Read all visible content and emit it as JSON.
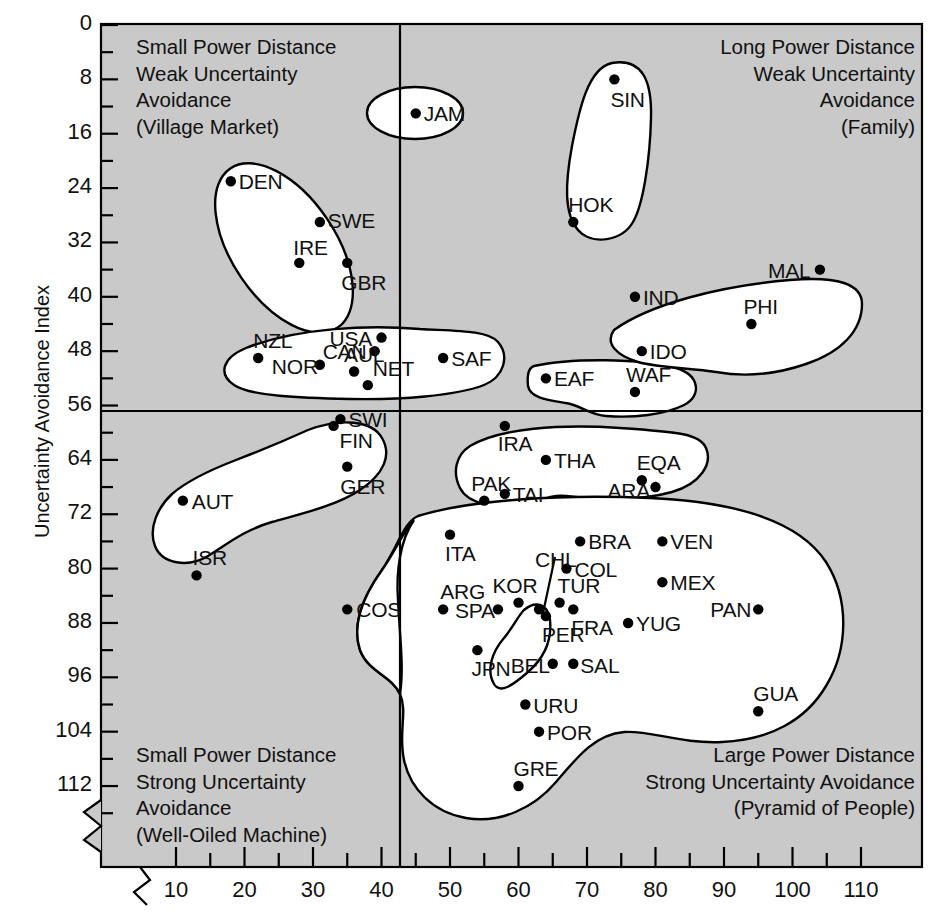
{
  "figure": {
    "title": "",
    "y_axis_label": "Uncertainty Avoidance Index",
    "x_axis_label": ""
  },
  "quadrant_captions": {
    "top_left": [
      "Small Power Distance",
      "Weak Uncertainty",
      "Avoidance",
      "(Village Market)"
    ],
    "top_right": [
      "Long Power Distance",
      "Weak Uncertainty",
      "Avoidance",
      "(Family)"
    ],
    "bottom_left": [
      "Small Power Distance",
      "Strong Uncertainty",
      "Avoidance",
      "(Well-Oiled Machine)"
    ],
    "bottom_right": [
      "Large Power Distance",
      "Strong Uncertainty Avoidance",
      "(Pyramid of People)"
    ]
  },
  "chart_data": {
    "type": "scatter",
    "xlabel": "Power Distance Index",
    "ylabel": "Uncertainty Avoidance Index",
    "xlim": [
      6,
      116
    ],
    "ylim": [
      0,
      116
    ],
    "y_inverted": true,
    "grid": false,
    "legend": "none",
    "axis_break_x": true,
    "axis_break_y": true,
    "xticks": [
      10,
      20,
      30,
      40,
      50,
      60,
      70,
      80,
      90,
      100,
      110
    ],
    "xminor_step": 5,
    "yticks": [
      0,
      8,
      16,
      24,
      32,
      40,
      48,
      56,
      64,
      72,
      80,
      88,
      96,
      104,
      112
    ],
    "yminor_step": 4,
    "quadrant_divider_x": 44,
    "quadrant_divider_y": 56,
    "points": [
      {
        "code": "JAM",
        "x": 45,
        "y": 13,
        "lx": 8,
        "ly": 0
      },
      {
        "code": "SIN",
        "x": 74,
        "y": 8,
        "lx": -4,
        "ly": 20
      },
      {
        "code": "HOK",
        "x": 68,
        "y": 29,
        "lx": -5,
        "ly": -18
      },
      {
        "code": "DEN",
        "x": 18,
        "y": 23,
        "lx": 8,
        "ly": 0
      },
      {
        "code": "SWE",
        "x": 31,
        "y": 29,
        "lx": 8,
        "ly": -2
      },
      {
        "code": "IRE",
        "x": 28,
        "y": 35,
        "lx": -6,
        "ly": -16
      },
      {
        "code": "GBR",
        "x": 35,
        "y": 35,
        "lx": -6,
        "ly": 19
      },
      {
        "code": "MAL",
        "x": 104,
        "y": 36,
        "lx": -52,
        "ly": 0
      },
      {
        "code": "IND",
        "x": 77,
        "y": 40,
        "lx": 8,
        "ly": 0
      },
      {
        "code": "PHI",
        "x": 94,
        "y": 44,
        "lx": -8,
        "ly": -18
      },
      {
        "code": "IDO",
        "x": 78,
        "y": 48,
        "lx": 8,
        "ly": 0
      },
      {
        "code": "USA",
        "x": 40,
        "y": 46,
        "lx": -52,
        "ly": 0
      },
      {
        "code": "CAN",
        "x": 39,
        "y": 48,
        "lx": -52,
        "ly": 0
      },
      {
        "code": "NZL",
        "x": 22,
        "y": 49,
        "lx": -5,
        "ly": -18
      },
      {
        "code": "NOR",
        "x": 31,
        "y": 50,
        "lx": -48,
        "ly": 1
      },
      {
        "code": "AUL",
        "x": 36,
        "y": 51,
        "lx": -10,
        "ly": -18
      },
      {
        "code": "NET",
        "x": 38,
        "y": 53,
        "lx": 5,
        "ly": -17
      },
      {
        "code": "SAF",
        "x": 49,
        "y": 49,
        "lx": 8,
        "ly": 0
      },
      {
        "code": "EAF",
        "x": 64,
        "y": 52,
        "lx": 8,
        "ly": 0
      },
      {
        "code": "WAF",
        "x": 77,
        "y": 54,
        "lx": -9,
        "ly": -18
      },
      {
        "code": "SWI",
        "x": 34,
        "y": 58,
        "lx": 8,
        "ly": 0
      },
      {
        "code": "FIN",
        "x": 33,
        "y": 59,
        "lx": 6,
        "ly": 14
      },
      {
        "code": "GER",
        "x": 35,
        "y": 65,
        "lx": -7,
        "ly": 19
      },
      {
        "code": "AUT",
        "x": 11,
        "y": 70,
        "lx": 9,
        "ly": 0
      },
      {
        "code": "ISR",
        "x": 13,
        "y": 81,
        "lx": -4,
        "ly": -18
      },
      {
        "code": "IRA",
        "x": 58,
        "y": 59,
        "lx": -7,
        "ly": 17
      },
      {
        "code": "THA",
        "x": 64,
        "y": 64,
        "lx": 8,
        "ly": 0
      },
      {
        "code": "EQA",
        "x": 78,
        "y": 67,
        "lx": -5,
        "ly": -18
      },
      {
        "code": "PAK",
        "x": 55,
        "y": 70,
        "lx": -13,
        "ly": -18
      },
      {
        "code": "TAI",
        "x": 58,
        "y": 69,
        "lx": 8,
        "ly": 0
      },
      {
        "code": "ARA",
        "x": 80,
        "y": 68,
        "lx": -48,
        "ly": 3
      },
      {
        "code": "COS",
        "x": 35,
        "y": 86,
        "lx": 9,
        "ly": 0
      },
      {
        "code": "ITA",
        "x": 50,
        "y": 75,
        "lx": -5,
        "ly": 18
      },
      {
        "code": "BRA",
        "x": 69,
        "y": 76,
        "lx": 8,
        "ly": 0
      },
      {
        "code": "VEN",
        "x": 81,
        "y": 76,
        "lx": 8,
        "ly": 0
      },
      {
        "code": "CHL",
        "x": 63,
        "y": 86,
        "lx": -4,
        "ly": -50,
        "leader": true
      },
      {
        "code": "COL",
        "x": 67,
        "y": 80,
        "lx": 8,
        "ly": 0
      },
      {
        "code": "KOR",
        "x": 60,
        "y": 85,
        "lx": -26,
        "ly": -18
      },
      {
        "code": "MEX",
        "x": 81,
        "y": 82,
        "lx": 8,
        "ly": 0
      },
      {
        "code": "ARG",
        "x": 49,
        "y": 86,
        "lx": -3,
        "ly": -18
      },
      {
        "code": "SPA",
        "x": 57,
        "y": 86,
        "lx": -43,
        "ly": 1
      },
      {
        "code": "TUR",
        "x": 66,
        "y": 85,
        "lx": -2,
        "ly": -18
      },
      {
        "code": "PAN",
        "x": 95,
        "y": 86,
        "lx": -48,
        "ly": 0
      },
      {
        "code": "FRA",
        "x": 68,
        "y": 86,
        "lx": -2,
        "ly": 18
      },
      {
        "code": "PER",
        "x": 64,
        "y": 87,
        "lx": -4,
        "ly": 18
      },
      {
        "code": "YUG",
        "x": 76,
        "y": 88,
        "lx": 8,
        "ly": 0
      },
      {
        "code": "JPN",
        "x": 54,
        "y": 92,
        "lx": -6,
        "ly": 18
      },
      {
        "code": "BEL",
        "x": 65,
        "y": 94,
        "lx": -42,
        "ly": 1
      },
      {
        "code": "SAL",
        "x": 68,
        "y": 94,
        "lx": 7,
        "ly": 1
      },
      {
        "code": "URU",
        "x": 61,
        "y": 100,
        "lx": 8,
        "ly": 0
      },
      {
        "code": "POR",
        "x": 63,
        "y": 104,
        "lx": 8,
        "ly": 0
      },
      {
        "code": "GUA",
        "x": 95,
        "y": 101,
        "lx": -5,
        "ly": -18
      },
      {
        "code": "GRE",
        "x": 60,
        "y": 112,
        "lx": -5,
        "ly": -18
      }
    ]
  },
  "colors": {
    "plot_background": "#c9c9c9",
    "blob_fill": "#ffffff",
    "line": "#000000",
    "text": "#111111"
  }
}
